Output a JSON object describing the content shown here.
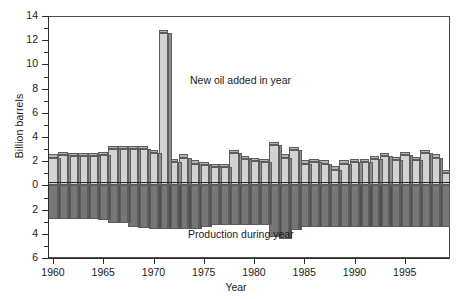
{
  "chart_data": {
    "type": "bar",
    "title": "",
    "subtitle": "",
    "xlabel": "Year",
    "ylabel": "Billion barrels",
    "xlim": [
      1959.5,
      1999.5
    ],
    "ylim": [
      -6,
      14
    ],
    "grid": false,
    "legend_position": "inline-annotations",
    "y_tick_labels": [
      "14",
      "12",
      "10",
      "8",
      "6",
      "4",
      "2",
      "0",
      "2",
      "4",
      "6"
    ],
    "y_tick_values": [
      14,
      12,
      10,
      8,
      6,
      4,
      2,
      0,
      -2,
      -4,
      -6
    ],
    "y_minor_step": 1,
    "x_tick_labels": [
      "1960",
      "1965",
      "1970",
      "1975",
      "1980",
      "1985",
      "1990",
      "1995"
    ],
    "x_tick_values": [
      1960,
      1965,
      1970,
      1975,
      1980,
      1985,
      1990,
      1995
    ],
    "annotations": [
      {
        "name": "new-oil-label",
        "text": "New oil added in year",
        "x": 1974,
        "y": 9.1
      },
      {
        "name": "production-label",
        "text": "Production during year",
        "x": 1974,
        "y": -4.0
      }
    ],
    "colors": {
      "new_oil_face": "#d2d2d2",
      "new_oil_side": "#8e8e8e",
      "production_face": "#767676",
      "production_side": "#4f4f4f",
      "axis": "#2b2b2b",
      "outline": "#5d5d5d",
      "background": "#ffffff"
    },
    "categories": [
      1960,
      1961,
      1962,
      1963,
      1964,
      1965,
      1966,
      1967,
      1968,
      1969,
      1970,
      1971,
      1972,
      1973,
      1974,
      1975,
      1976,
      1977,
      1978,
      1979,
      1980,
      1981,
      1982,
      1983,
      1984,
      1985,
      1986,
      1987,
      1988,
      1989,
      1990,
      1991,
      1992,
      1993,
      1994,
      1995,
      1996,
      1997,
      1998,
      1999
    ],
    "series": [
      {
        "name": "New oil added in year",
        "unit": "billion barrels",
        "direction": "up",
        "values": [
          2.3,
          2.5,
          2.4,
          2.4,
          2.4,
          2.5,
          3.0,
          3.0,
          3.0,
          3.0,
          2.7,
          12.6,
          1.9,
          2.3,
          1.8,
          1.7,
          1.5,
          1.5,
          2.7,
          2.2,
          2.0,
          1.9,
          3.3,
          2.3,
          2.9,
          1.8,
          1.9,
          1.8,
          1.3,
          1.8,
          1.9,
          1.9,
          2.2,
          2.4,
          2.1,
          2.5,
          2.1,
          2.7,
          2.3,
          1.0
        ]
      },
      {
        "name": "Production during year",
        "unit": "billion barrels",
        "direction": "down",
        "values": [
          -2.8,
          -2.8,
          -2.8,
          -2.8,
          -2.8,
          -2.9,
          -3.1,
          -3.1,
          -3.4,
          -3.5,
          -3.6,
          -3.6,
          -3.6,
          -3.6,
          -3.6,
          -3.4,
          -3.3,
          -3.3,
          -3.3,
          -3.3,
          -3.3,
          -3.3,
          -4.3,
          -4.4,
          -3.7,
          -3.4,
          -3.4,
          -3.4,
          -3.4,
          -3.4,
          -3.4,
          -3.4,
          -3.4,
          -3.4,
          -3.4,
          -3.4,
          -3.4,
          -3.4,
          -3.4,
          -3.4
        ]
      }
    ]
  }
}
